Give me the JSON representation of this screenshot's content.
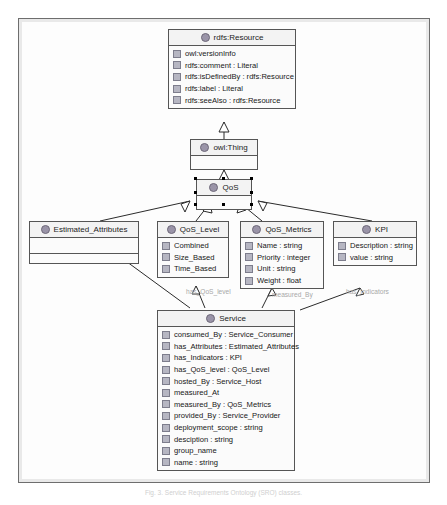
{
  "diagram": {
    "caption": "Fig. 3. Service Requirements Ontology (SRO) classes.",
    "class_icon_name": "owl-class-icon",
    "property_icon_name": "owl-property-icon",
    "colors": {
      "box_border": "#555555",
      "box_fill": "#fbfbfb",
      "header_fill": "#f3f3f3",
      "class_icon": "#9a94a8",
      "property_icon": "#b6b6c2",
      "edge": "#2b2b2b",
      "edge_label": "#a8a8a8",
      "frame_border": "#6e6e6e"
    },
    "classes": [
      {
        "id": "rdfs-resource",
        "name": "rdfs:Resource",
        "attributes": [
          "owl:versionInfo",
          "rdfs:comment : Literal",
          "rdfs:isDefinedBy : rdfs:Resource",
          "rdfs:label : Literal",
          "rdfs:seeAlso : rdfs:Resource"
        ]
      },
      {
        "id": "owl-thing",
        "name": "owl:Thing",
        "attributes": []
      },
      {
        "id": "qos",
        "name": "QoS",
        "attributes": [],
        "selected": true
      },
      {
        "id": "estimated-attributes",
        "name": "Estimated_Attributes",
        "attributes": []
      },
      {
        "id": "qos-level",
        "name": "QoS_Level",
        "attributes": [
          "Combined",
          "Size_Based",
          "Time_Based"
        ]
      },
      {
        "id": "qos-metrics",
        "name": "QoS_Metrics",
        "attributes": [
          "Name : string",
          "Priority : integer",
          "Unit : string",
          "Weight : float"
        ]
      },
      {
        "id": "kpi",
        "name": "KPI",
        "attributes": [
          "Description : string",
          "value : string"
        ]
      },
      {
        "id": "service",
        "name": "Service",
        "attributes": [
          "consumed_By : Service_Consumer",
          "has_Attributes : Estimated_Attributes",
          "has_Indicators : KPI",
          "has_QoS_level : QoS_Level",
          "hosted_By : Service_Host",
          "measured_At",
          "measured_By : QoS_Metrics",
          "provided_By : Service_Provider",
          "deployment_scope : string",
          "desciption : string",
          "group_name",
          "name : string"
        ]
      }
    ],
    "edge_labels": [
      {
        "id": "has-attributes",
        "text": "has_Attributes"
      },
      {
        "id": "has-qos-level",
        "text": "has_QoS_level"
      },
      {
        "id": "measured-by",
        "text": "measured_By"
      },
      {
        "id": "has-indicators",
        "text": "has_Indicators"
      }
    ]
  }
}
